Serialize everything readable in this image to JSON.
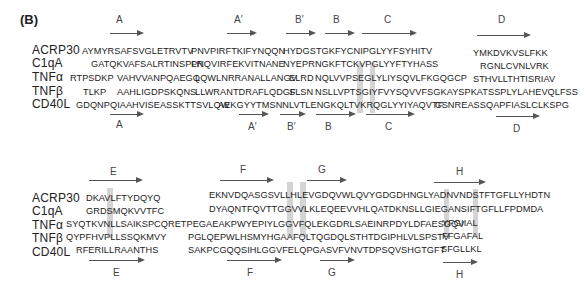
{
  "panel_label": "(B)",
  "proteins": [
    "ACRP30",
    "C1qA",
    "TNFα",
    "TNFβ",
    "CD40L"
  ],
  "block1": {
    "rows": [
      {
        "name": "ACRP30",
        "segs": [
          "AYMYRSAFSVGLETRVTV",
          "PNVPIRFTKIFYNQQN",
          "HYDGSTGKFYCNIPGLYYFSYHITV",
          "YMKDVKVSLFKK"
        ]
      },
      {
        "name": "C1qA",
        "segs": [
          "GATQKVAFSALRTINSPLR",
          "PNQVIRFEKVITNANE",
          "NYEPRNGKFTCKVPGLYYFTYHASS",
          "RGNLCVNLVRK"
        ]
      },
      {
        "name": "TNFα",
        "segs": [
          "RTPSDKP",
          "VAHVVANPQAEGQ",
          "LQWLNRRANALLANGV",
          "ELRD",
          "NQLVVPSEGLYLIYSQVLFKGQGCP",
          "STHVLLTHTISRIAV"
        ]
      },
      {
        "name": "TNFβ",
        "segs": [
          "TLKP",
          "AAHLIGDPSKQNS",
          "LLWRANTDRAFLQDGF",
          "SLSN",
          "NSLLVPTSGIYFVYSQVVFSGKAYSPKATSSPLYLAHEVQLFSS"
        ]
      },
      {
        "name": "CD40L",
        "segs": [
          "GDQNPQIAAHVISEASSKTTSVLQW",
          "AEKGYYTMSNNLVTLENGKQLTVKRQGLYYIYAQVTF",
          "CSNREASSQAPFIASLCLKSPG"
        ]
      }
    ],
    "top_strands": [
      "A",
      "A′",
      "B′",
      "B",
      "C",
      "D"
    ],
    "bottom_strands": [
      "A",
      "A′",
      "B′",
      "B",
      "C",
      "D"
    ]
  },
  "block2": {
    "rows": [
      {
        "name": "ACRP30",
        "segs": [
          "DKAVLFTYDQYQ",
          "EKNVDQASGSVLLHLEVGDQVWLQVYGDGDHNGLYADNVNDSTFTGFLLYHDTN"
        ]
      },
      {
        "name": "C1qA",
        "segs": [
          "GRDSMQKVVTFC",
          "DYAQNTFQVTTGGVVLKLEQEEVVHLQATDKNSLLGIEGANSIFTGFLLFPDMDA"
        ]
      },
      {
        "name": "TNFα",
        "segs": [
          "SYQTKVNLLSAIKSPCQRETPEGAEAKPWYEPIYLGGVFQLEKGDRLSAEINRPDYLDFAESGQV",
          "YFGIIAL"
        ]
      },
      {
        "name": "TNFβ",
        "segs": [
          "QYPFHVPLLSSQKMVY",
          "PGLQEPWLHSMYHGAAFQLTQGDQLSTHTDGIPHLVLSPSTV",
          "FFGAFAL"
        ]
      },
      {
        "name": "CD40L",
        "segs": [
          "RFERILLRAANTHS",
          "SAKPCGQQSIHLGGVFELQPGASVFVNVTDPSQVSHGTGFT",
          "SFGLLKL"
        ]
      }
    ],
    "top_strands": [
      "E",
      "F",
      "G",
      "H"
    ],
    "bottom_strands": [
      "E",
      "F",
      "G",
      "H"
    ]
  }
}
